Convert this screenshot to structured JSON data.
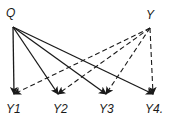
{
  "diagram": {
    "type": "directed-graph",
    "nodes": [
      {
        "id": "Q",
        "label": "Q",
        "x": 13,
        "y": 14,
        "anchor_x": 13,
        "anchor_y": 27
      },
      {
        "id": "Y",
        "label": "Y",
        "x": 151,
        "y": 15,
        "anchor_x": 150,
        "anchor_y": 28
      },
      {
        "id": "Y1",
        "label": "Y1",
        "x": 15,
        "y": 109,
        "anchor_x": 14,
        "anchor_y": 94
      },
      {
        "id": "Y2",
        "label": "Y2",
        "x": 61,
        "y": 109,
        "anchor_x": 58,
        "anchor_y": 94
      },
      {
        "id": "Y3",
        "label": "Y3",
        "x": 107,
        "y": 109,
        "anchor_x": 106,
        "anchor_y": 94
      },
      {
        "id": "Y4",
        "label": "Y4.",
        "x": 155,
        "y": 109,
        "anchor_x": 153,
        "anchor_y": 94
      }
    ],
    "edges": [
      {
        "from": "Q",
        "to": "Y1",
        "style": "solid"
      },
      {
        "from": "Q",
        "to": "Y2",
        "style": "solid"
      },
      {
        "from": "Q",
        "to": "Y3",
        "style": "solid"
      },
      {
        "from": "Q",
        "to": "Y4",
        "style": "solid"
      },
      {
        "from": "Y",
        "to": "Y1",
        "style": "dashed"
      },
      {
        "from": "Y",
        "to": "Y2",
        "style": "dashed"
      },
      {
        "from": "Y",
        "to": "Y3",
        "style": "dashed"
      },
      {
        "from": "Y",
        "to": "Y4",
        "style": "dashed"
      }
    ],
    "colors": {
      "line": "#1a1a1a",
      "background": "#ffffff"
    }
  }
}
